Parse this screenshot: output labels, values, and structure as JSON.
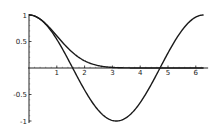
{
  "chart_data": {
    "type": "line",
    "title": "",
    "xlabel": "",
    "ylabel": "",
    "xlim": [
      0,
      6.3
    ],
    "ylim": [
      -1,
      1
    ],
    "grid": false,
    "legend": null,
    "x_ticks": [
      1,
      2,
      3,
      4,
      5,
      6
    ],
    "x_tick_labels": [
      "1",
      "2",
      "3",
      "4",
      "5",
      "6"
    ],
    "y_ticks": [
      1,
      0.5,
      -0.5,
      -1
    ],
    "y_tick_labels": [
      "1",
      "0.5",
      "-0.5",
      "-1"
    ],
    "series": [
      {
        "name": "cos(x)",
        "x": [
          0,
          0.5,
          1,
          1.5,
          2,
          2.5,
          3,
          3.14,
          3.5,
          4,
          4.5,
          5,
          5.5,
          6,
          6.28
        ],
        "values": [
          1,
          0.878,
          0.54,
          0.071,
          -0.416,
          -0.801,
          -0.99,
          -1,
          -0.936,
          -0.654,
          -0.211,
          0.284,
          0.709,
          0.96,
          1
        ]
      },
      {
        "name": "exp(-x^2/2)",
        "x": [
          0,
          0.5,
          1,
          1.5,
          2,
          2.5,
          3,
          3.5,
          4,
          4.5,
          5,
          5.5,
          6,
          6.28
        ],
        "values": [
          1,
          0.882,
          0.607,
          0.325,
          0.135,
          0.044,
          0.011,
          0.002,
          0.0003,
          0,
          0,
          0,
          0,
          0
        ]
      }
    ]
  }
}
